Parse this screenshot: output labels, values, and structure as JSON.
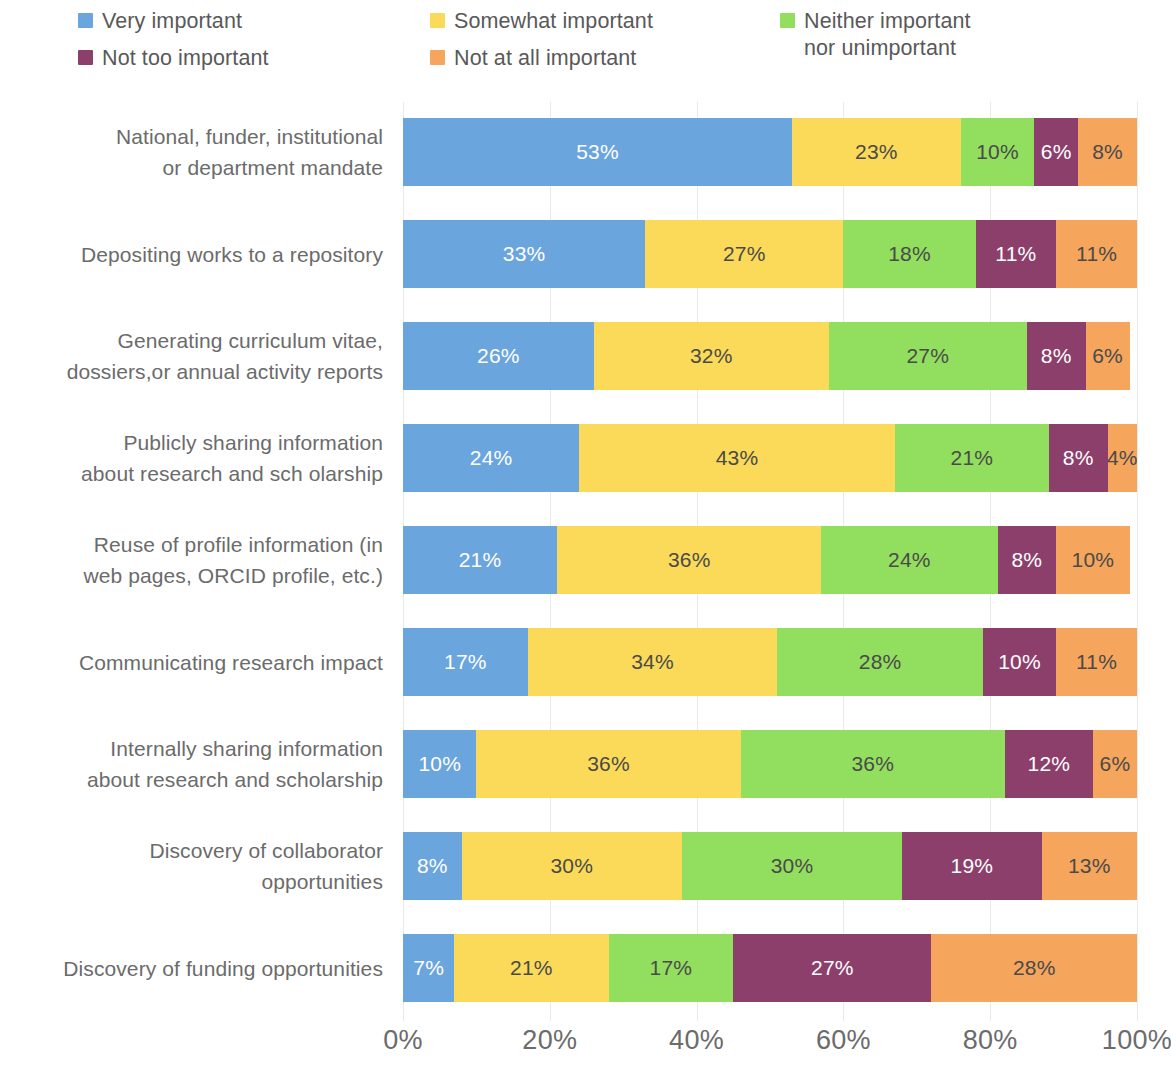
{
  "legend": {
    "items": [
      {
        "label": "Very important",
        "color": "#6ba5de",
        "swatch_name": "legend-swatch-very-important"
      },
      {
        "label": "Somewhat important",
        "color": "#fada58",
        "swatch_name": "legend-swatch-somewhat-important"
      },
      {
        "label": "Neither important\nnor unimportant",
        "color": "#92de5f",
        "swatch_name": "legend-swatch-neither-important"
      },
      {
        "label": "Not too important",
        "color": "#8d3f6b",
        "swatch_name": "legend-swatch-not-too-important"
      },
      {
        "label": "Not at all important",
        "color": "#f5a55c",
        "swatch_name": "legend-swatch-not-at-all-important"
      }
    ]
  },
  "axis": {
    "ticks": [
      "0%",
      "20%",
      "40%",
      "60%",
      "80%",
      "100%"
    ],
    "tick_values": [
      0,
      20,
      40,
      60,
      80,
      100
    ]
  },
  "chart_data": {
    "type": "bar",
    "orientation": "horizontal",
    "stacked": true,
    "normalized_percent": true,
    "title": "",
    "subtitle": "",
    "xlabel": "",
    "ylabel": "",
    "xlim": [
      0,
      100
    ],
    "grid": true,
    "legend_position": "top",
    "series": [
      {
        "name": "Very important",
        "color": "#6ba5de",
        "label_color": "#ffffff",
        "values": [
          53,
          33,
          26,
          24,
          21,
          17,
          10,
          8,
          7
        ]
      },
      {
        "name": "Somewhat important",
        "color": "#fada58",
        "label_color": "#4a4a4a",
        "values": [
          23,
          27,
          32,
          43,
          36,
          34,
          36,
          30,
          21
        ]
      },
      {
        "name": "Neither important nor unimportant",
        "color": "#92de5f",
        "label_color": "#4a4a4a",
        "values": [
          10,
          18,
          27,
          21,
          24,
          28,
          36,
          30,
          17
        ]
      },
      {
        "name": "Not too important",
        "color": "#8d3f6b",
        "label_color": "#ffffff",
        "values": [
          6,
          11,
          8,
          8,
          8,
          10,
          12,
          19,
          27
        ]
      },
      {
        "name": "Not at all important",
        "color": "#f5a55c",
        "label_color": "#4a4a4a",
        "values": [
          8,
          11,
          6,
          4,
          10,
          11,
          6,
          13,
          28
        ]
      }
    ],
    "categories": [
      "National, funder, institutional or department mandate",
      "Depositing works to a repository",
      "Generating curriculum vitae, dossiers,or annual activity reports",
      "Publicly sharing information about research and sch olarship",
      "Reuse of profile information (in web pages, ORCID profile, etc.)",
      "Communicating research impact",
      "Internally sharing information about research and scholarship",
      "Discovery of collaborator opportunities",
      "Discovery of funding opportunities"
    ],
    "category_lines": [
      [
        "National, funder, institutional",
        "or department mandate"
      ],
      [
        "Depositing works to a repository"
      ],
      [
        "Generating curriculum vitae,",
        "dossiers,or annual activity reports"
      ],
      [
        "Publicly sharing information",
        "about research and sch olarship"
      ],
      [
        "Reuse of profile information (in",
        "web pages, ORCID profile, etc.)"
      ],
      [
        "Communicating research impact"
      ],
      [
        "Internally sharing information",
        "about research and scholarship"
      ],
      [
        "Discovery of collaborator",
        "opportunities"
      ],
      [
        "Discovery of funding opportunities"
      ]
    ],
    "data_labels": [
      [
        "53%",
        "23%",
        "10%",
        "6%",
        "8%"
      ],
      [
        "33%",
        "27%",
        "18%",
        "11%",
        "11%"
      ],
      [
        "26%",
        "32%",
        "27%",
        "8%",
        "6%"
      ],
      [
        "24%",
        "43%",
        "21%",
        "8%",
        "4%"
      ],
      [
        "21%",
        "36%",
        "24%",
        "8%",
        "10%"
      ],
      [
        "17%",
        "34%",
        "28%",
        "10%",
        "11%"
      ],
      [
        "10%",
        "36%",
        "36%",
        "12%",
        "6%"
      ],
      [
        "8%",
        "30%",
        "30%",
        "19%",
        "13%"
      ],
      [
        "7%",
        "21%",
        "17%",
        "27%",
        "28%"
      ]
    ]
  }
}
